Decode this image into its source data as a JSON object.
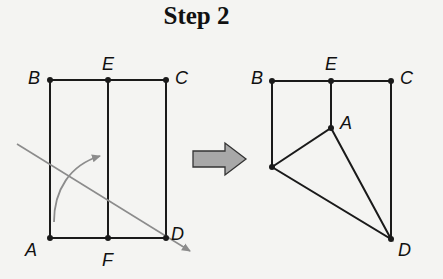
{
  "title": "Step 2",
  "left_figure": {
    "labels": {
      "B": "B",
      "E": "E",
      "C": "C",
      "A": "A",
      "F": "F",
      "D": "D"
    }
  },
  "right_figure": {
    "labels": {
      "B": "B",
      "E": "E",
      "C": "C",
      "A": "A",
      "D": "D"
    }
  },
  "colors": {
    "line": "#1a1a1a",
    "fold_line": "#8c8c8c",
    "arrow_fill": "#a8a8a8",
    "background": "#f4f4f2"
  }
}
